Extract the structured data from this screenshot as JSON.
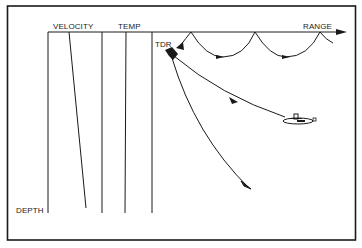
{
  "diagram": {
    "labels": {
      "velocity": "VELOCITY",
      "temp": "TEMP",
      "tdr": "TDR",
      "range": "RANGE",
      "depth": "DEPTH"
    },
    "elements": {
      "transmitter": "TDR transducer",
      "target": "submarine",
      "rays": [
        "surface-bounce ray",
        "ray to submarine",
        "deep refracted ray"
      ]
    },
    "colors": {
      "ink": "#1a1a1a",
      "background": "#ffffff"
    }
  }
}
